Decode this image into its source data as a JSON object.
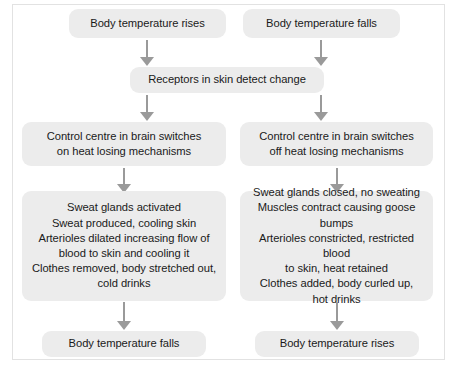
{
  "diagram": {
    "accent_color": "#ececec",
    "arrow_color": "#9a9a9a",
    "text_color": "#1a1a1a",
    "frame_color": "#e2e2e2"
  },
  "nodes": {
    "top_left": "Body temperature rises",
    "top_right": "Body temperature falls",
    "receptors": "Receptors in skin detect change",
    "control_left": "Control centre in brain switches\non heat losing mechanisms",
    "control_right": "Control centre in brain switches\noff heat losing mechanisms",
    "effects_left": "Sweat glands activated\nSweat produced, cooling skin\nArterioles dilated increasing flow of\nblood to skin and cooling it\nClothes removed, body stretched out,\ncold drinks",
    "effects_right": "Sweat glands closed, no sweating\nMuscles contract causing goose bumps\nArterioles constricted, restricted blood\nto skin, heat retained\nClothes added, body curled up,\nhot drinks",
    "bottom_left": "Body temperature falls",
    "bottom_right": "Body temperature rises"
  },
  "arrows": [
    {
      "name": "arrow-top-left-to-receptors",
      "from": "top_left",
      "to": "receptors"
    },
    {
      "name": "arrow-top-right-to-receptors",
      "from": "top_right",
      "to": "receptors"
    },
    {
      "name": "arrow-receptors-to-control-left",
      "from": "receptors",
      "to": "control_left"
    },
    {
      "name": "arrow-receptors-to-control-right",
      "from": "receptors",
      "to": "control_right"
    },
    {
      "name": "arrow-control-left-to-effects-left",
      "from": "control_left",
      "to": "effects_left"
    },
    {
      "name": "arrow-control-right-to-effects-right",
      "from": "control_right",
      "to": "effects_right"
    },
    {
      "name": "arrow-effects-left-to-bottom-left",
      "from": "effects_left",
      "to": "bottom_left"
    },
    {
      "name": "arrow-effects-right-to-bottom-right",
      "from": "effects_right",
      "to": "bottom_right"
    }
  ]
}
